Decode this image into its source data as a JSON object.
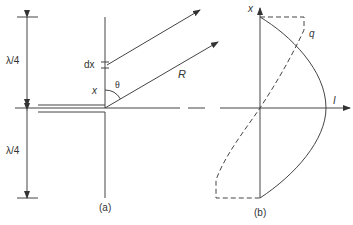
{
  "figure": {
    "panel_a": {
      "caption": "(a)",
      "labels": {
        "upper_quarter": "λ/4",
        "lower_quarter": "λ/4",
        "dx": "dx",
        "x": "x",
        "theta": "θ",
        "R": "R"
      },
      "description": "Half-wave dipole antenna with feed line; element dx at height x, distant observation point at distance R and angle θ"
    },
    "panel_b": {
      "caption": "(b)",
      "labels": {
        "x_axis": "x",
        "I_axis": "I",
        "q": "q"
      },
      "curves": [
        {
          "name": "current I",
          "style": "solid",
          "shape": "cosine, zero at ends, max at centre"
        },
        {
          "name": "charge q",
          "style": "dashed",
          "shape": "sine, zero at centre, opposite sign in each half"
        }
      ]
    },
    "colors": {
      "line": "#333333",
      "background": "#ffffff"
    }
  }
}
